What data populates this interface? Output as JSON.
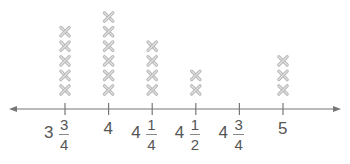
{
  "chart_data": {
    "type": "scatter",
    "subtype": "line-plot (dot plot with x marks)",
    "title": "",
    "xlabel": "",
    "ylabel": "",
    "categories": [
      "3 3/4",
      "4",
      "4 1/4",
      "4 1/2",
      "4 3/4",
      "5"
    ],
    "x": [
      3.75,
      4.0,
      4.25,
      4.5,
      4.75,
      5.0
    ],
    "values": [
      5,
      6,
      4,
      2,
      0,
      3
    ],
    "marker": "x",
    "xlim": [
      3.75,
      5.0
    ],
    "grid": false,
    "legend": null,
    "axis_arrows": "both ends",
    "tick_labels": [
      {
        "whole": "3",
        "num": "3",
        "den": "4"
      },
      {
        "whole": "4",
        "num": "",
        "den": ""
      },
      {
        "whole": "4",
        "num": "1",
        "den": "4"
      },
      {
        "whole": "4",
        "num": "1",
        "den": "2"
      },
      {
        "whole": "4",
        "num": "3",
        "den": "4"
      },
      {
        "whole": "5",
        "num": "",
        "den": ""
      }
    ]
  },
  "colors": {
    "axis": "#777777",
    "marker": "#b8b8b8",
    "label": "#555555"
  }
}
